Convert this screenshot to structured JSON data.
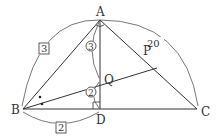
{
  "diagram": {
    "points": {
      "A": {
        "label": "A",
        "x": 100,
        "y": 20
      },
      "B": {
        "label": "B",
        "x": 23,
        "y": 109
      },
      "C": {
        "label": "C",
        "x": 197,
        "y": 109
      },
      "D": {
        "label": "D",
        "x": 100,
        "y": 109
      },
      "P": {
        "label": "P",
        "x": 157,
        "y": 68
      },
      "Q": {
        "label": "Q",
        "x": 100,
        "y": 80
      }
    },
    "measures": {
      "AB": "3",
      "AC": "20",
      "BD": "2",
      "AQ": "3",
      "QD": "2"
    },
    "line_color": "#333333"
  }
}
